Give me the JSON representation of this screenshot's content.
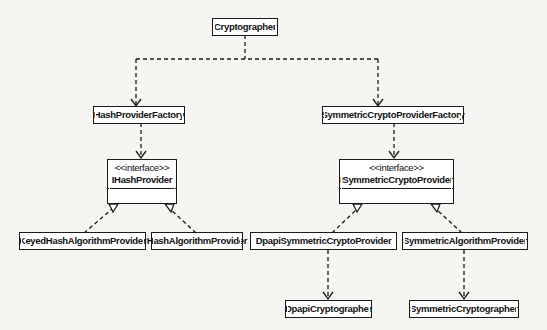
{
  "diagram": {
    "type": "uml-class",
    "nodes": {
      "cryptographer": {
        "label": "Cryptographer"
      },
      "hash_factory": {
        "label": "HashProviderFactory"
      },
      "sym_factory": {
        "label": "SymmetricCryptoProviderFactory"
      },
      "ihash": {
        "stereotype": "<<interface>>",
        "label": "IHashProvider"
      },
      "isym": {
        "stereotype": "<<interface>>",
        "label": "ISymmetricCryptoProvider"
      },
      "keyed_hash": {
        "label": "KeyedHashAlgorithmProvider"
      },
      "hash_alg": {
        "label": "HashAlgorithmProvider"
      },
      "dpapi_sym": {
        "label": "DpapiSymmetricCryptoProvider"
      },
      "sym_alg": {
        "label": "SymmetricAlgorithmProvider"
      },
      "dpapi_crypto": {
        "label": "DpapiCryptographer"
      },
      "sym_crypto": {
        "label": "SymmetricCryptographer"
      }
    },
    "edges": [
      {
        "from": "Cryptographer",
        "to": "HashProviderFactory",
        "kind": "dependency"
      },
      {
        "from": "Cryptographer",
        "to": "SymmetricCryptoProviderFactory",
        "kind": "dependency"
      },
      {
        "from": "HashProviderFactory",
        "to": "IHashProvider",
        "kind": "dependency"
      },
      {
        "from": "SymmetricCryptoProviderFactory",
        "to": "ISymmetricCryptoProvider",
        "kind": "dependency"
      },
      {
        "from": "KeyedHashAlgorithmProvider",
        "to": "IHashProvider",
        "kind": "realization"
      },
      {
        "from": "HashAlgorithmProvider",
        "to": "IHashProvider",
        "kind": "realization"
      },
      {
        "from": "DpapiSymmetricCryptoProvider",
        "to": "ISymmetricCryptoProvider",
        "kind": "realization"
      },
      {
        "from": "SymmetricAlgorithmProvider",
        "to": "ISymmetricCryptoProvider",
        "kind": "realization"
      },
      {
        "from": "DpapiSymmetricCryptoProvider",
        "to": "DpapiCryptographer",
        "kind": "dependency"
      },
      {
        "from": "SymmetricAlgorithmProvider",
        "to": "SymmetricCryptographer",
        "kind": "dependency"
      }
    ]
  }
}
